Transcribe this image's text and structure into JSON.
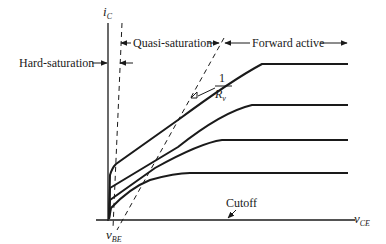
{
  "diagram": {
    "axes": {
      "y_label": "i",
      "y_label_sub": "C",
      "x_label": "v",
      "x_label_sub": "CE",
      "origin_label": "v",
      "origin_label_sub": "BE"
    },
    "regions": {
      "hard_saturation": "Hard-saturation",
      "quasi_saturation": "Quasi-saturation",
      "forward_active": "Forward active",
      "cutoff": "Cutoff"
    },
    "slope_annotation": {
      "numerator": "1",
      "denominator": "R",
      "denominator_sub": "v"
    },
    "curves_count": 4,
    "colors": {
      "line": "#1a1a1a",
      "background": "#ffffff"
    }
  }
}
